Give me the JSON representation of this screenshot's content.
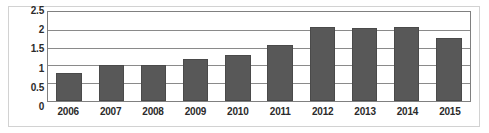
{
  "chart_data": {
    "type": "bar",
    "title": "",
    "subtitle": "",
    "xlabel": "",
    "ylabel": "",
    "categories": [
      "2006",
      "2007",
      "2008",
      "2009",
      "2010",
      "2011",
      "2012",
      "2013",
      "2014",
      "2015"
    ],
    "values": [
      0.78,
      1.0,
      1.0,
      1.18,
      1.3,
      1.58,
      2.07,
      2.05,
      2.07,
      1.76
    ],
    "ylim": [
      0,
      2.5
    ],
    "yticks": [
      "0",
      "0.5",
      "1",
      "1.5",
      "2",
      "2.5"
    ],
    "ytick_values": [
      0,
      0.5,
      1,
      1.5,
      2,
      2.5
    ],
    "grid": true,
    "grid_axis": "y",
    "legend": false,
    "legend_position": "none",
    "annotations": [],
    "colors": {
      "bar_fill": "#585858",
      "bar_border": "#4a4a4a",
      "gridline": "#8a8a8a",
      "plot_border": "#808080",
      "outer_frame": "#d2d2d2",
      "background": "#ffffff",
      "tick_label": "#2b2b2b"
    }
  }
}
